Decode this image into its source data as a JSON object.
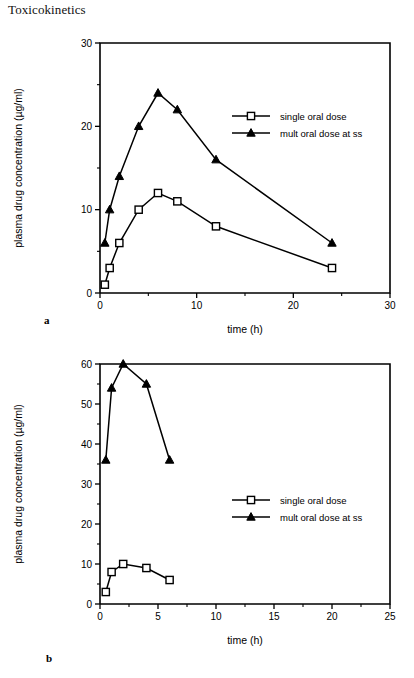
{
  "header": {
    "running_title": "Toxicokinetics"
  },
  "figures": [
    {
      "panel_label": "a",
      "legend": [
        {
          "marker": "open-square",
          "label": "single oral dose"
        },
        {
          "marker": "filled-triangle",
          "label": "mult oral dose at ss"
        }
      ]
    },
    {
      "panel_label": "b",
      "legend": [
        {
          "marker": "open-square",
          "label": "single oral dose"
        },
        {
          "marker": "filled-triangle",
          "label": "mult oral dose at ss"
        }
      ]
    }
  ],
  "chart_data": [
    {
      "type": "line",
      "panel": "a",
      "title": "",
      "xlabel": "time (h)",
      "ylabel": "plasma drug concentration (µg/ml)",
      "xlim": [
        0,
        30
      ],
      "ylim": [
        0,
        30
      ],
      "xticks": [
        0,
        10,
        20,
        30
      ],
      "xtick_labels": [
        "0",
        "10",
        "20",
        "30"
      ],
      "xticks_minor": [
        5,
        15,
        25
      ],
      "yticks": [
        0,
        10,
        20,
        30
      ],
      "ytick_labels": [
        "0",
        "10",
        "20",
        "30"
      ],
      "yticks_minor": [
        5,
        15,
        25
      ],
      "grid": false,
      "legend_position": "upper right",
      "series": [
        {
          "name": "single oral dose",
          "marker": "open-square",
          "x": [
            0.5,
            1,
            2,
            4,
            6,
            8,
            12,
            24
          ],
          "values": [
            1,
            3,
            6,
            10,
            12,
            11,
            8,
            3
          ]
        },
        {
          "name": "mult oral dose at ss",
          "marker": "filled-triangle",
          "x": [
            0.5,
            1,
            2,
            4,
            6,
            8,
            12,
            24
          ],
          "values": [
            6,
            10,
            14,
            20,
            24,
            22,
            16,
            6
          ]
        }
      ]
    },
    {
      "type": "line",
      "panel": "b",
      "title": "",
      "xlabel": "time (h)",
      "ylabel": "plasma drug concentration (µg/ml)",
      "xlim": [
        0,
        25
      ],
      "ylim": [
        0,
        60
      ],
      "xticks": [
        0,
        5,
        10,
        15,
        20,
        25
      ],
      "xtick_labels": [
        "0",
        "5",
        "10",
        "15",
        "20",
        "25"
      ],
      "xticks_minor": [
        2.5,
        7.5,
        12.5,
        17.5,
        22.5
      ],
      "yticks": [
        0,
        10,
        20,
        30,
        40,
        50,
        60
      ],
      "ytick_labels": [
        "0",
        "10",
        "20",
        "30",
        "40",
        "50",
        "60"
      ],
      "yticks_minor": [
        5,
        15,
        25,
        35,
        45,
        55
      ],
      "grid": false,
      "legend_position": "center right",
      "series": [
        {
          "name": "single oral dose",
          "marker": "open-square",
          "x": [
            0.5,
            1,
            2,
            4,
            6
          ],
          "values": [
            3,
            8,
            10,
            9,
            6
          ]
        },
        {
          "name": "mult oral dose at ss",
          "marker": "filled-triangle",
          "x": [
            0.5,
            1,
            2,
            4,
            6
          ],
          "values": [
            36,
            54,
            60,
            55,
            36
          ]
        }
      ]
    }
  ]
}
